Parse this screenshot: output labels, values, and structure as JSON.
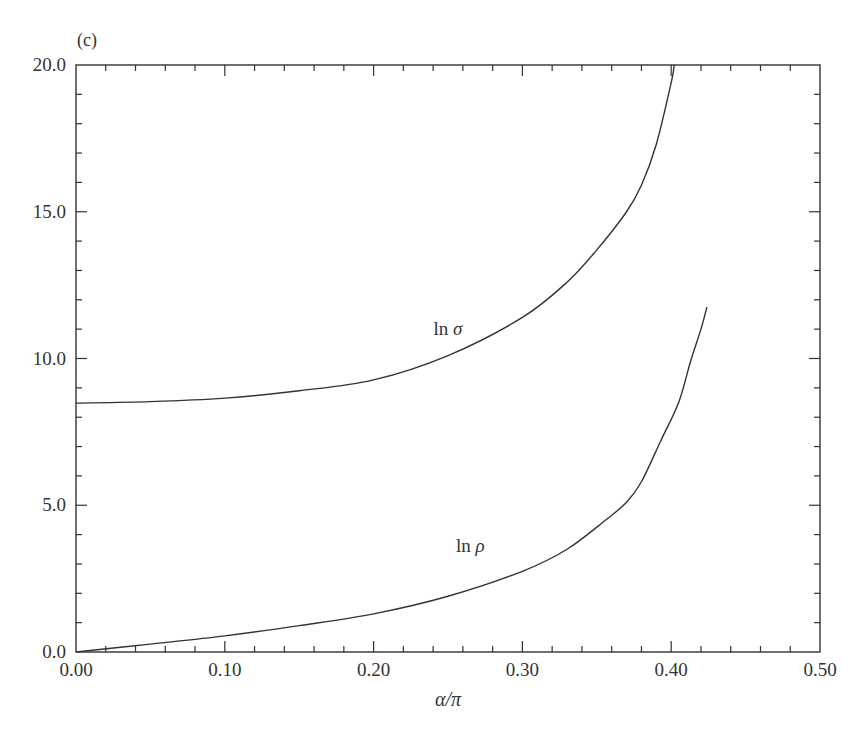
{
  "panel_label": "(c)",
  "chart_data": {
    "type": "line",
    "title": "",
    "xlabel": "α/π",
    "ylabel": "",
    "xlim": [
      0.0,
      0.5
    ],
    "ylim": [
      0.0,
      20.0
    ],
    "grid": false,
    "legend": "none (curves labelled inline)",
    "x_ticks": [
      "0.00",
      "0.10",
      "0.20",
      "0.30",
      "0.40",
      "0.50"
    ],
    "y_ticks": [
      "0.0",
      "5.0",
      "10.0",
      "15.0",
      "20.0"
    ],
    "x_minor_step": 0.02,
    "y_minor_step": 1.0,
    "series": [
      {
        "name": "ln σ",
        "label_position": {
          "x": 0.25,
          "y": 10.8
        },
        "x": [
          0.0,
          0.05,
          0.1,
          0.15,
          0.2,
          0.25,
          0.3,
          0.33,
          0.35,
          0.37,
          0.38,
          0.39,
          0.4,
          0.402
        ],
        "y": [
          8.48,
          8.53,
          8.65,
          8.9,
          9.27,
          10.1,
          11.4,
          12.6,
          13.7,
          15.0,
          15.9,
          17.3,
          19.4,
          20.0
        ]
      },
      {
        "name": "ln ρ",
        "label_position": {
          "x": 0.265,
          "y": 3.4
        },
        "x": [
          0.0,
          0.05,
          0.1,
          0.15,
          0.2,
          0.25,
          0.3,
          0.33,
          0.356,
          0.37,
          0.38,
          0.393,
          0.405,
          0.413,
          0.42,
          0.424
        ],
        "y": [
          0.0,
          0.27,
          0.55,
          0.9,
          1.3,
          1.9,
          2.75,
          3.5,
          4.5,
          5.1,
          5.8,
          7.2,
          8.5,
          9.9,
          11.0,
          11.75
        ]
      }
    ]
  }
}
